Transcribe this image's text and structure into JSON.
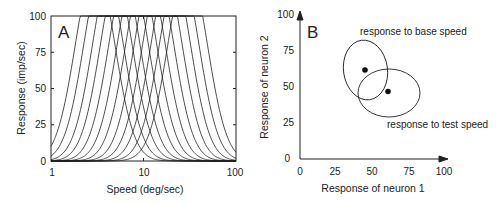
{
  "chart_data": [
    {
      "panel": "A",
      "type": "line",
      "title": "",
      "xlabel": "Speed (deg/sec)",
      "ylabel": "Response (imp/sec)",
      "xscale": "log",
      "xlim": [
        1,
        100
      ],
      "ylim": [
        0,
        100
      ],
      "xticks": [
        "1",
        "10",
        "100"
      ],
      "yticks": [
        "0",
        "25",
        "50",
        "75",
        "100"
      ],
      "grid": false,
      "legend": null,
      "description": "12 log-Gaussian speed tuning curves, each saturating at 100 imp/sec",
      "series": [
        {
          "name": "neuron 1",
          "peak_speed": 3.0,
          "max_response": 100
        },
        {
          "name": "neuron 2",
          "peak_speed": 3.7,
          "max_response": 100
        },
        {
          "name": "neuron 3",
          "peak_speed": 4.6,
          "max_response": 100
        },
        {
          "name": "neuron 4",
          "peak_speed": 5.6,
          "max_response": 100
        },
        {
          "name": "neuron 5",
          "peak_speed": 6.9,
          "max_response": 100
        },
        {
          "name": "neuron 6",
          "peak_speed": 8.5,
          "max_response": 100
        },
        {
          "name": "neuron 7",
          "peak_speed": 10.5,
          "max_response": 100
        },
        {
          "name": "neuron 8",
          "peak_speed": 13.0,
          "max_response": 100
        },
        {
          "name": "neuron 9",
          "peak_speed": 16.0,
          "max_response": 100
        },
        {
          "name": "neuron 10",
          "peak_speed": 19.7,
          "max_response": 100
        },
        {
          "name": "neuron 11",
          "peak_speed": 24.3,
          "max_response": 100
        },
        {
          "name": "neuron 12",
          "peak_speed": 30.0,
          "max_response": 100
        }
      ]
    },
    {
      "panel": "B",
      "type": "scatter",
      "title": "",
      "xlabel": "Response of neuron 1",
      "ylabel": "Response of neuron 2",
      "xlim": [
        0,
        100
      ],
      "ylim": [
        0,
        100
      ],
      "xticks": [
        "0",
        "25",
        "50",
        "75",
        "100"
      ],
      "yticks": [
        "0",
        "25",
        "50",
        "75",
        "100"
      ],
      "grid": false,
      "points": [
        {
          "name": "base speed mean",
          "x": 45,
          "y": 61
        },
        {
          "name": "test speed mean",
          "x": 61,
          "y": 47
        }
      ],
      "ellipses": [
        {
          "name": "response to base speed",
          "cx": 45,
          "cy": 61,
          "rx": 15,
          "ry": 21,
          "tilt_deg": -8
        },
        {
          "name": "response to test speed",
          "cx": 62,
          "cy": 46,
          "rx": 21,
          "ry": 16,
          "tilt_deg": 0
        }
      ],
      "annotations": [
        "response to base speed",
        "response to test speed"
      ]
    }
  ],
  "panelA": {
    "label": "A",
    "ylabel": "Response (imp/sec)",
    "xlabel": "Speed (deg/sec)",
    "yticks": [
      "100",
      "75",
      "50",
      "25",
      "0"
    ],
    "xticks": [
      "1",
      "10",
      "100"
    ]
  },
  "panelB": {
    "label": "B",
    "ylabel": "Response of neuron 2",
    "xlabel": "Response of neuron 1",
    "yticks": [
      "100",
      "75",
      "50",
      "25",
      "0"
    ],
    "xticks": [
      "0",
      "25",
      "50",
      "75",
      "100"
    ],
    "annotation_base": "response to base speed",
    "annotation_test": "response to test speed"
  }
}
